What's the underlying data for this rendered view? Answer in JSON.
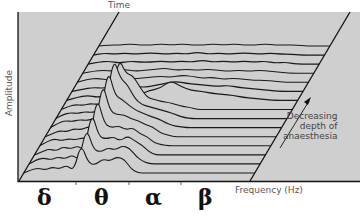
{
  "figure": {
    "time_label": "Time",
    "amplitude_label": "Amplitude",
    "frequency_label": "Frequency (Hz)",
    "annotation_lines": [
      "Decreasing",
      "depth of",
      "anaesthesia"
    ],
    "bands": [
      "δ",
      "θ",
      "α",
      "β"
    ],
    "colors": {
      "panel": "#cfcfcf",
      "line": "#1a1a1a",
      "background": "#ffffff"
    }
  },
  "chart_data": {
    "type": "line",
    "xlabel": "Frequency (Hz)",
    "ylabel": "Amplitude",
    "zlabel": "Time",
    "x_bands": [
      "δ",
      "θ",
      "α",
      "β"
    ],
    "annotation": "Decreasing depth of anaesthesia (arrow pointing toward later time)",
    "n_traces": 15,
    "traces": [
      {
        "t": 0,
        "offsets": [
          0,
          3,
          5,
          3,
          6,
          4,
          8,
          2,
          30,
          10,
          8,
          14,
          12,
          16,
          14,
          4,
          0,
          0,
          0,
          0,
          0
        ]
      },
      {
        "t": 1,
        "offsets": [
          0,
          4,
          6,
          4,
          7,
          5,
          9,
          4,
          37,
          14,
          12,
          16,
          14,
          18,
          16,
          7,
          2,
          0,
          0,
          0,
          0
        ]
      },
      {
        "t": 2,
        "offsets": [
          0,
          3,
          6,
          4,
          8,
          6,
          9,
          5,
          44,
          18,
          16,
          18,
          14,
          19,
          14,
          10,
          3,
          0,
          0,
          0,
          0
        ]
      },
      {
        "t": 3,
        "offsets": [
          0,
          4,
          7,
          5,
          7,
          6,
          8,
          7,
          50,
          22,
          18,
          20,
          16,
          18,
          12,
          9,
          3,
          1,
          0,
          0,
          0
        ]
      },
      {
        "t": 4,
        "offsets": [
          0,
          3,
          6,
          5,
          8,
          7,
          10,
          9,
          56,
          26,
          22,
          22,
          18,
          16,
          12,
          10,
          4,
          2,
          0,
          0,
          0
        ]
      },
      {
        "t": 5,
        "offsets": [
          0,
          4,
          7,
          6,
          8,
          7,
          9,
          10,
          60,
          32,
          28,
          22,
          17,
          14,
          11,
          9,
          5,
          2,
          1,
          0,
          0
        ]
      },
      {
        "t": 6,
        "offsets": [
          0,
          4,
          6,
          5,
          7,
          6,
          8,
          9,
          62,
          40,
          34,
          20,
          14,
          12,
          10,
          8,
          6,
          3,
          1,
          0,
          0
        ]
      },
      {
        "t": 7,
        "offsets": [
          0,
          3,
          5,
          4,
          6,
          5,
          7,
          8,
          52,
          36,
          34,
          22,
          12,
          10,
          8,
          7,
          5,
          3,
          2,
          0,
          0
        ]
      },
      {
        "t": 8,
        "offsets": [
          0,
          3,
          5,
          3,
          5,
          4,
          6,
          6,
          10,
          12,
          20,
          14,
          10,
          9,
          7,
          6,
          5,
          3,
          2,
          1,
          0
        ]
      },
      {
        "t": 9,
        "offsets": [
          0,
          2,
          4,
          3,
          5,
          3,
          5,
          4,
          6,
          8,
          10,
          8,
          7,
          6,
          5,
          6,
          4,
          3,
          2,
          1,
          0
        ]
      },
      {
        "t": 10,
        "offsets": [
          0,
          3,
          4,
          2,
          5,
          3,
          4,
          5,
          6,
          5,
          7,
          6,
          4,
          5,
          3,
          4,
          3,
          2,
          2,
          1,
          0
        ]
      },
      {
        "t": 11,
        "offsets": [
          0,
          2,
          3,
          2,
          4,
          2,
          3,
          4,
          5,
          3,
          4,
          3,
          4,
          3,
          2,
          3,
          2,
          3,
          2,
          1,
          0
        ]
      },
      {
        "t": 12,
        "offsets": [
          0,
          2,
          3,
          1,
          3,
          2,
          2,
          3,
          2,
          3,
          2,
          4,
          2,
          3,
          2,
          3,
          2,
          3,
          1,
          2,
          0
        ]
      },
      {
        "t": 13,
        "offsets": [
          0,
          2,
          1,
          2,
          1,
          2,
          2,
          1,
          2,
          1,
          3,
          1,
          2,
          1,
          2,
          2,
          1,
          2,
          1,
          1,
          0
        ]
      },
      {
        "t": 14,
        "offsets": [
          0,
          1,
          1,
          2,
          1,
          1,
          2,
          1,
          2,
          1,
          1,
          2,
          1,
          2,
          1,
          1,
          2,
          1,
          1,
          1,
          0
        ]
      }
    ]
  }
}
